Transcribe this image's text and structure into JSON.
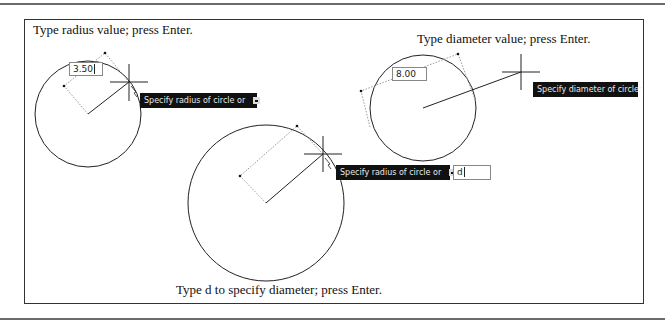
{
  "captions": {
    "top_left": "Type radius value; press Enter.",
    "top_right": "Type diameter value; press Enter.",
    "bottom": "Type d to specify diameter; press Enter."
  },
  "panels": [
    {
      "id": "radius-value",
      "input_value": "3.50",
      "tooltip": "Specify radius of circle or",
      "tooltip_has_dropdown": true
    },
    {
      "id": "d-option",
      "input_value": "d",
      "tooltip": "Specify radius of circle or",
      "tooltip_has_dropdown": true
    },
    {
      "id": "diameter-value",
      "input_value": "8.00",
      "tooltip": "Specify diameter of circle:",
      "tooltip_has_dropdown": false
    }
  ],
  "colors": {
    "tooltip_bg": "#111111",
    "tooltip_text": "#e8e8e8",
    "geometry": "#222222",
    "dimension_dotted": "#999999"
  }
}
